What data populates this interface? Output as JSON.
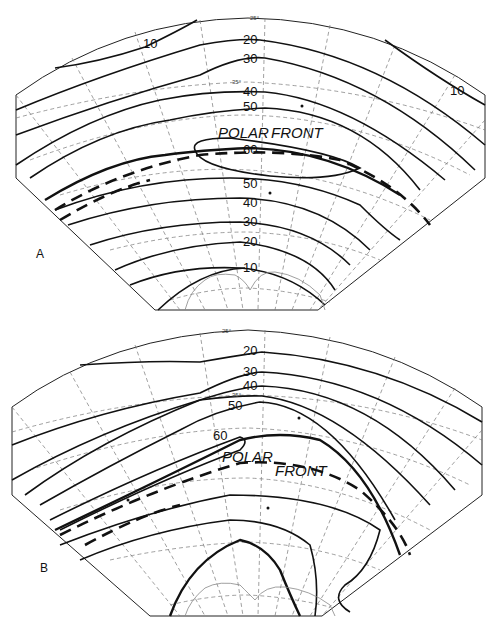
{
  "figure": {
    "panels": [
      {
        "id": "A",
        "letter": "A",
        "front_label_1": "POLAR",
        "front_label_2": "FRONT",
        "latitude_labels": {
          "lat25": "25°",
          "lat35": "35°",
          "lat40": "40°",
          "lat50": "50°",
          "lat60": "60°",
          "lat70": "70°"
        },
        "contour_labels": {
          "c10_top": "10",
          "c10_right": "10",
          "c20": "20",
          "c30": "30",
          "c40": "40",
          "c50": "50",
          "c60": "60",
          "c50b": "50",
          "c40b": "40",
          "c30b": "30",
          "c20b": "20",
          "c10b": "10"
        }
      },
      {
        "id": "B",
        "letter": "B",
        "front_label_1": "POLAR",
        "front_label_2": "FRONT",
        "latitude_labels": {
          "lat25": "25°",
          "lat35": "35°",
          "lat40": "40°",
          "lat50": "50°",
          "lat60": "60°",
          "lat70": "70°"
        },
        "contour_labels": {
          "c20": "20",
          "c30": "30",
          "c40": "40",
          "c50": "50",
          "c60": "60"
        }
      }
    ]
  }
}
